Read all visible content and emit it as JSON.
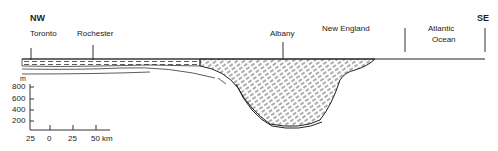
{
  "directions": {
    "left": "NW",
    "right": "SE"
  },
  "places": [
    {
      "name": "Toronto"
    },
    {
      "name": "Rochester"
    },
    {
      "name": "Albany"
    },
    {
      "name": "New England"
    },
    {
      "name": "Atlantic",
      "name2": "Ocean"
    }
  ],
  "vertical_scale": {
    "unit": "m",
    "ticks": [
      "800",
      "600",
      "400",
      "200"
    ]
  },
  "horizontal_scale": {
    "ticks": [
      "25",
      "0",
      "25",
      "50 km"
    ]
  }
}
